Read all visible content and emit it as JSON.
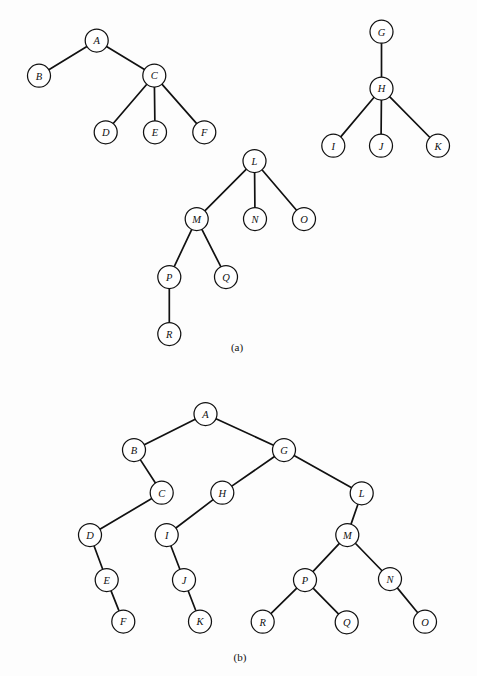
{
  "figure": {
    "background_color": "#fdfdfd",
    "ink_color": "#111111",
    "node_radius": 11.5,
    "width": 477,
    "height": 676
  },
  "panels": [
    {
      "id": "panel-a",
      "caption": "(a)",
      "caption_x": 237,
      "caption_y": 347,
      "description": "forest of three general trees",
      "trees": [
        {
          "id": "tree-a-1",
          "root": "A",
          "nodes": [
            {
              "label": "A",
              "x": 96.7,
              "y": 40.5
            },
            {
              "label": "B",
              "x": 39.0,
              "y": 75.7
            },
            {
              "label": "C",
              "x": 154.3,
              "y": 75.5
            },
            {
              "label": "D",
              "x": 105.7,
              "y": 132.3
            },
            {
              "label": "E",
              "x": 155.0,
              "y": 132.3
            },
            {
              "label": "F",
              "x": 204.3,
              "y": 132.3
            }
          ],
          "edges": [
            {
              "from": "A",
              "to": "B"
            },
            {
              "from": "A",
              "to": "C"
            },
            {
              "from": "C",
              "to": "D"
            },
            {
              "from": "C",
              "to": "E"
            },
            {
              "from": "C",
              "to": "F"
            }
          ]
        },
        {
          "id": "tree-a-2",
          "root": "G",
          "nodes": [
            {
              "label": "G",
              "x": 381.5,
              "y": 31.7
            },
            {
              "label": "H",
              "x": 381.5,
              "y": 88.5
            },
            {
              "label": "I",
              "x": 333.3,
              "y": 145.7
            },
            {
              "label": "J",
              "x": 381.0,
              "y": 145.7
            },
            {
              "label": "K",
              "x": 438.0,
              "y": 145.7
            }
          ],
          "edges": [
            {
              "from": "G",
              "to": "H"
            },
            {
              "from": "H",
              "to": "I"
            },
            {
              "from": "H",
              "to": "J"
            },
            {
              "from": "H",
              "to": "K"
            }
          ]
        },
        {
          "id": "tree-a-3",
          "root": "L",
          "nodes": [
            {
              "label": "L",
              "x": 254.5,
              "y": 161.0
            },
            {
              "label": "M",
              "x": 196.7,
              "y": 219.0
            },
            {
              "label": "N",
              "x": 255.0,
              "y": 219.0
            },
            {
              "label": "O",
              "x": 304.0,
              "y": 219.0
            },
            {
              "label": "P",
              "x": 169.3,
              "y": 277.0
            },
            {
              "label": "Q",
              "x": 226.0,
              "y": 277.0
            },
            {
              "label": "R",
              "x": 169.3,
              "y": 334.0
            }
          ],
          "edges": [
            {
              "from": "L",
              "to": "M"
            },
            {
              "from": "L",
              "to": "N"
            },
            {
              "from": "L",
              "to": "O"
            },
            {
              "from": "M",
              "to": "P"
            },
            {
              "from": "M",
              "to": "Q"
            },
            {
              "from": "P",
              "to": "R"
            }
          ]
        }
      ]
    },
    {
      "id": "panel-b",
      "caption": "(b)",
      "caption_x": 240,
      "caption_y": 657,
      "description": "corresponding binary tree representation",
      "trees": [
        {
          "id": "tree-b-1",
          "root": "A",
          "nodes": [
            {
              "label": "A",
              "x": 205.5,
              "y": 414.0
            },
            {
              "label": "B",
              "x": 134.0,
              "y": 450.0
            },
            {
              "label": "G",
              "x": 284.0,
              "y": 450.0
            },
            {
              "label": "C",
              "x": 161.7,
              "y": 492.7
            },
            {
              "label": "H",
              "x": 222.3,
              "y": 492.7
            },
            {
              "label": "L",
              "x": 361.7,
              "y": 493.3
            },
            {
              "label": "D",
              "x": 90.0,
              "y": 535.0
            },
            {
              "label": "I",
              "x": 166.7,
              "y": 535.0
            },
            {
              "label": "M",
              "x": 347.3,
              "y": 535.0
            },
            {
              "label": "E",
              "x": 106.7,
              "y": 580.0
            },
            {
              "label": "J",
              "x": 184.0,
              "y": 580.0
            },
            {
              "label": "P",
              "x": 305.0,
              "y": 580.0
            },
            {
              "label": "N",
              "x": 390.0,
              "y": 579.0
            },
            {
              "label": "F",
              "x": 123.3,
              "y": 621.5
            },
            {
              "label": "K",
              "x": 200.0,
              "y": 621.5
            },
            {
              "label": "R",
              "x": 262.7,
              "y": 621.7
            },
            {
              "label": "Q",
              "x": 346.7,
              "y": 622.3
            },
            {
              "label": "O",
              "x": 425.0,
              "y": 621.7
            }
          ],
          "edges": [
            {
              "from": "A",
              "to": "B"
            },
            {
              "from": "A",
              "to": "G"
            },
            {
              "from": "B",
              "to": "C"
            },
            {
              "from": "G",
              "to": "H"
            },
            {
              "from": "G",
              "to": "L"
            },
            {
              "from": "C",
              "to": "D"
            },
            {
              "from": "H",
              "to": "I"
            },
            {
              "from": "L",
              "to": "M"
            },
            {
              "from": "D",
              "to": "E"
            },
            {
              "from": "I",
              "to": "J"
            },
            {
              "from": "M",
              "to": "P"
            },
            {
              "from": "M",
              "to": "N"
            },
            {
              "from": "E",
              "to": "F"
            },
            {
              "from": "J",
              "to": "K"
            },
            {
              "from": "P",
              "to": "R"
            },
            {
              "from": "P",
              "to": "Q"
            },
            {
              "from": "N",
              "to": "O"
            }
          ]
        }
      ]
    }
  ]
}
